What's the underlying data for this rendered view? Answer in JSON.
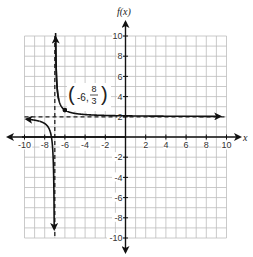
{
  "chart_data": {
    "type": "line",
    "title": "",
    "xlabel": "x",
    "ylabel": "f(x)",
    "xlim": [
      -10,
      10
    ],
    "ylim": [
      -10,
      10
    ],
    "grid": true,
    "x_ticks": [
      -10,
      -8,
      -6,
      -4,
      -2,
      2,
      4,
      6,
      8,
      10
    ],
    "y_ticks": [
      10,
      8,
      6,
      4,
      2,
      -2,
      -4,
      -6,
      -8,
      -10
    ],
    "x_tick_labels": [
      "-10",
      "-8",
      "-6",
      "-4",
      "-2",
      "2",
      "4",
      "6",
      "8",
      "10"
    ],
    "y_tick_labels": [
      "10",
      "8",
      "6",
      "4",
      "2",
      "-2",
      "-4",
      "-6",
      "-8",
      "-10"
    ],
    "function": "f(x) = (2/3)/(x + 7) + 2",
    "asymptotes": {
      "vertical": -7,
      "horizontal": 2,
      "style": "dashed"
    },
    "series": [
      {
        "name": "right branch",
        "x": [
          -6.93,
          -6.9,
          -6.8,
          -6.6,
          -6.3,
          -6,
          -5,
          -4,
          -2,
          0,
          2,
          4,
          6,
          8,
          10
        ],
        "values": [
          11.52,
          8.67,
          5.33,
          3.67,
          2.95,
          2.67,
          2.33,
          2.22,
          2.13,
          2.1,
          2.07,
          2.06,
          2.05,
          2.04,
          2.04
        ]
      },
      {
        "name": "left branch",
        "x": [
          -10,
          -9,
          -8,
          -7.5,
          -7.3,
          -7.2,
          -7.1,
          -7.07
        ],
        "values": [
          1.78,
          1.67,
          1.33,
          0.67,
          -0.22,
          -1.33,
          -4.67,
          -7.52
        ]
      }
    ],
    "annotations": [
      {
        "text": "(-6, 8/3)",
        "x": -6,
        "y": 2.6667,
        "marked_point": true
      }
    ],
    "legend": null
  },
  "labels": {
    "y_axis": "f(x)",
    "x_axis": "x",
    "point_x": "-6,",
    "point_num": "8",
    "point_den": "3"
  }
}
